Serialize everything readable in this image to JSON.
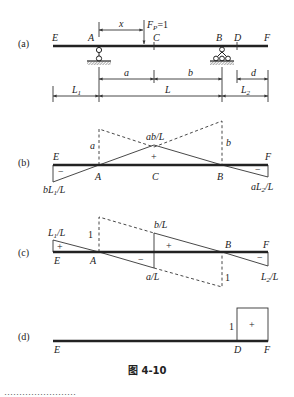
{
  "figure": {
    "caption": "图 4-10",
    "footer_text_cut": "……………………"
  },
  "panel_a": {
    "tag": "(a)",
    "points": {
      "E": "E",
      "A": "A",
      "C": "C",
      "B": "B",
      "D": "D",
      "F": "F"
    },
    "load_label": "F",
    "load_sub": "P",
    "load_value": "=1",
    "x_label": "x",
    "dims": {
      "a": "a",
      "b": "b",
      "d": "d",
      "L1": "L",
      "L1_sub": "1",
      "L": "L",
      "L2": "L",
      "L2_sub": "2"
    }
  },
  "panel_b": {
    "tag": "(b)",
    "points": {
      "E": "E",
      "A": "A",
      "C": "C",
      "B": "B",
      "F": "F"
    },
    "labels": {
      "a": "a",
      "b": "b",
      "abL": "ab/L",
      "left": "bL",
      "left_sub": "1",
      "left_tail": "/L",
      "right": "aL",
      "right_sub": "2",
      "right_tail": "/L"
    },
    "signs": {
      "left": "−",
      "mid": "+",
      "right": "−"
    }
  },
  "panel_c": {
    "tag": "(c)",
    "points": {
      "E": "E",
      "A": "A",
      "B": "B",
      "F": "F"
    },
    "labels": {
      "one_a": "1",
      "one_b": "1",
      "bL": "b/L",
      "aL": "a/L",
      "left": "L",
      "left_sub": "1",
      "left_tail": "/L",
      "right": "L",
      "right_sub": "2",
      "right_tail": "/L"
    },
    "signs": {
      "left": "+",
      "mid_neg": "−",
      "mid_pos": "+",
      "right": "−"
    }
  },
  "panel_d": {
    "tag": "(d)",
    "points": {
      "E": "E",
      "D": "D",
      "F": "F"
    },
    "labels": {
      "one": "1"
    },
    "signs": {
      "box": "+"
    }
  }
}
